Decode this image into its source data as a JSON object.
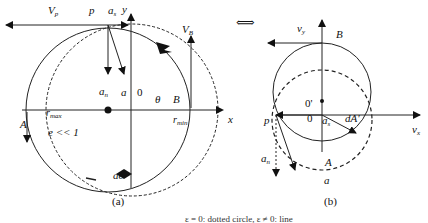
{
  "figure": {
    "equivalence_symbol": "⟺",
    "panel_a": {
      "caption": "(a)",
      "labels": {
        "vp": "V",
        "vp_sub": "p",
        "p": "p",
        "as": "a",
        "as_sub": "s",
        "y": "y",
        "vb": "V",
        "vb_sub": "B",
        "an": "a",
        "an_sub": "n",
        "a": "a",
        "zero": "0",
        "theta": "θ",
        "B": "B",
        "x": "x",
        "A": "A",
        "rmax": "r",
        "rmax_sub": "max",
        "rmin": "r",
        "rmin_sub": "min",
        "ecc": "e << 1",
        "ae": "ae"
      }
    },
    "panel_b": {
      "caption": "(b)",
      "labels": {
        "vy": "v",
        "vy_sub": "y",
        "B": "B",
        "origin_prime": "0'",
        "p": "p",
        "zero": "0",
        "as": "a",
        "as_sub": "s",
        "dA": "dA'",
        "vx": "v",
        "vx_sub": "x",
        "an": "a",
        "an_sub": "n",
        "A": "A",
        "a": "a"
      }
    },
    "bottom_caption": "ε = 0: dotted circle, ε ≠ 0: line"
  }
}
